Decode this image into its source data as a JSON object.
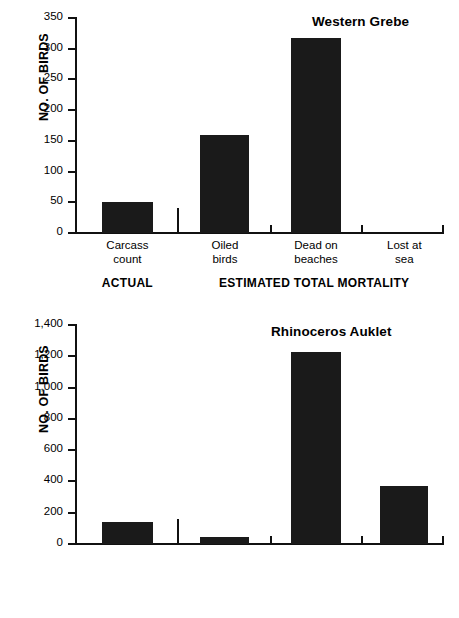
{
  "chart_data": [
    {
      "id": "western-grebe",
      "type": "bar",
      "title": "Western Grebe",
      "xlabel": "",
      "ylabel": "NO. OF BIRDS",
      "ylim": [
        0,
        350
      ],
      "ytick_step": 50,
      "ytick_labels": [
        "0",
        "50",
        "100",
        "150",
        "200",
        "250",
        "300",
        "350"
      ],
      "ytick_values": [
        0,
        50,
        100,
        150,
        200,
        250,
        300,
        350
      ],
      "grid": false,
      "legend": "none",
      "categories": [
        "Carcass count",
        "Oiled birds",
        "Dead on beaches",
        "Lost at sea"
      ],
      "category_lines": [
        [
          "Carcass",
          "count"
        ],
        [
          "Oiled",
          "birds"
        ],
        [
          "Dead on",
          "beaches"
        ],
        [
          "Lost at",
          "sea"
        ]
      ],
      "values": [
        50,
        160,
        317,
        0
      ],
      "groups": [
        {
          "label": "ACTUAL",
          "categories": [
            "Carcass count"
          ]
        },
        {
          "label": "ESTIMATED TOTAL MORTALITY",
          "categories": [
            "Oiled birds",
            "Dead on beaches",
            "Lost at sea"
          ]
        }
      ],
      "bar_color": "#1a1a1a"
    },
    {
      "id": "rhinoceros-auklet",
      "type": "bar",
      "title": "Rhinoceros Auklet",
      "xlabel": "",
      "ylabel": "NO. OF BIRDS",
      "ylim": [
        0,
        1400
      ],
      "ytick_step": 200,
      "ytick_labels": [
        "0",
        "200",
        "400",
        "600",
        "800",
        "1,000",
        "1,200",
        "1,400"
      ],
      "ytick_values": [
        0,
        200,
        400,
        600,
        800,
        1000,
        1200,
        1400
      ],
      "grid": false,
      "legend": "none",
      "categories": [
        "Carcass count",
        "Oiled birds",
        "Dead on beaches",
        "Lost at sea"
      ],
      "category_lines": [
        [
          "Carcass",
          "count"
        ],
        [
          "Oiled",
          "birds"
        ],
        [
          "Dead on",
          "beaches"
        ],
        [
          "Lost at",
          "sea"
        ]
      ],
      "values": [
        140,
        45,
        1225,
        370
      ],
      "groups": [
        {
          "label": "ACTUAL",
          "categories": [
            "Carcass count"
          ]
        },
        {
          "label": "ESTIMATED TOTAL MORTALITY",
          "categories": [
            "Oiled birds",
            "Dead on beaches",
            "Lost at sea"
          ]
        }
      ],
      "bar_color": "#1a1a1a"
    }
  ]
}
